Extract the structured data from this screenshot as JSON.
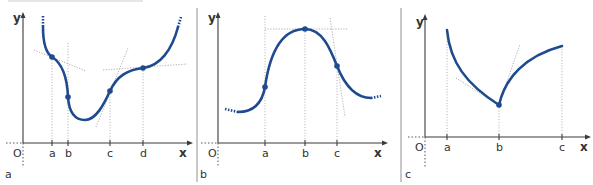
{
  "figure": {
    "colors": {
      "curve": "#1f4b8e",
      "axes": "#3a3a3a",
      "guides": "#9a9a9a",
      "separator": "#c8c8c8"
    },
    "panels": [
      {
        "id": "a",
        "label": "a",
        "origin_label": "O",
        "x_axis_label": "x",
        "y_axis_label": "y",
        "ticks": [
          "a",
          "b",
          "c",
          "d"
        ],
        "marked_points": [
          "a",
          "b",
          "c",
          "d"
        ],
        "tangents": [
          {
            "at": "a",
            "kind": "negative slope"
          },
          {
            "at": "c",
            "kind": "steep positive slope"
          },
          {
            "at": "d",
            "kind": "nearly horizontal"
          }
        ]
      },
      {
        "id": "b",
        "label": "b",
        "origin_label": "O",
        "x_axis_label": "x",
        "y_axis_label": "y",
        "ticks": [
          "a",
          "b",
          "c"
        ],
        "marked_points": [
          "a",
          "b",
          "c"
        ],
        "tangents": [
          {
            "at": "b",
            "kind": "horizontal (maximum)"
          },
          {
            "at": "c",
            "kind": "steep negative slope"
          }
        ]
      },
      {
        "id": "c",
        "label": "c",
        "origin_label": "O",
        "x_axis_label": "x",
        "y_axis_label": "y",
        "ticks": [
          "a",
          "b",
          "c"
        ],
        "marked_points": [
          "b"
        ],
        "tangents": [
          {
            "at": "b",
            "kind": "left one-sided tangent"
          },
          {
            "at": "b",
            "kind": "right one-sided tangent"
          }
        ]
      }
    ]
  }
}
